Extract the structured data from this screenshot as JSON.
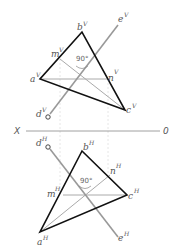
{
  "diagram": {
    "type": "descriptive-geometry-projection",
    "axis": {
      "left_label": "X",
      "right_label": "0",
      "y": 131
    },
    "angle_label": "90°",
    "colors": {
      "triangle": "#111111",
      "line": "#999999",
      "inner": "#aaaaaa",
      "guide": "#dddddd",
      "text": "#555555"
    },
    "vertical_view": {
      "points": {
        "a": {
          "label": "a",
          "sup": "V",
          "x": 40,
          "y": 79
        },
        "b": {
          "label": "b",
          "sup": "V",
          "x": 82,
          "y": 32
        },
        "c": {
          "label": "c",
          "sup": "V",
          "x": 125,
          "y": 110
        },
        "d": {
          "label": "d",
          "sup": "V",
          "x": 48,
          "y": 117
        },
        "e": {
          "label": "e",
          "sup": "V",
          "x": 118,
          "y": 25
        },
        "m": {
          "label": "m",
          "sup": "V",
          "x": 60,
          "y": 59
        },
        "n": {
          "label": "n",
          "sup": "V",
          "x": 108,
          "y": 79
        }
      }
    },
    "horizontal_view": {
      "points": {
        "a": {
          "label": "a",
          "sup": "H",
          "x": 40,
          "y": 232
        },
        "b": {
          "label": "b",
          "sup": "H",
          "x": 82,
          "y": 151
        },
        "c": {
          "label": "c",
          "sup": "H",
          "x": 127,
          "y": 195
        },
        "d": {
          "label": "d",
          "sup": "H",
          "x": 48,
          "y": 147
        },
        "e": {
          "label": "e",
          "sup": "H",
          "x": 118,
          "y": 237
        },
        "m": {
          "label": "m",
          "sup": "H",
          "x": 63,
          "y": 195
        },
        "n": {
          "label": "n",
          "sup": "H",
          "x": 110,
          "y": 175
        }
      }
    }
  }
}
